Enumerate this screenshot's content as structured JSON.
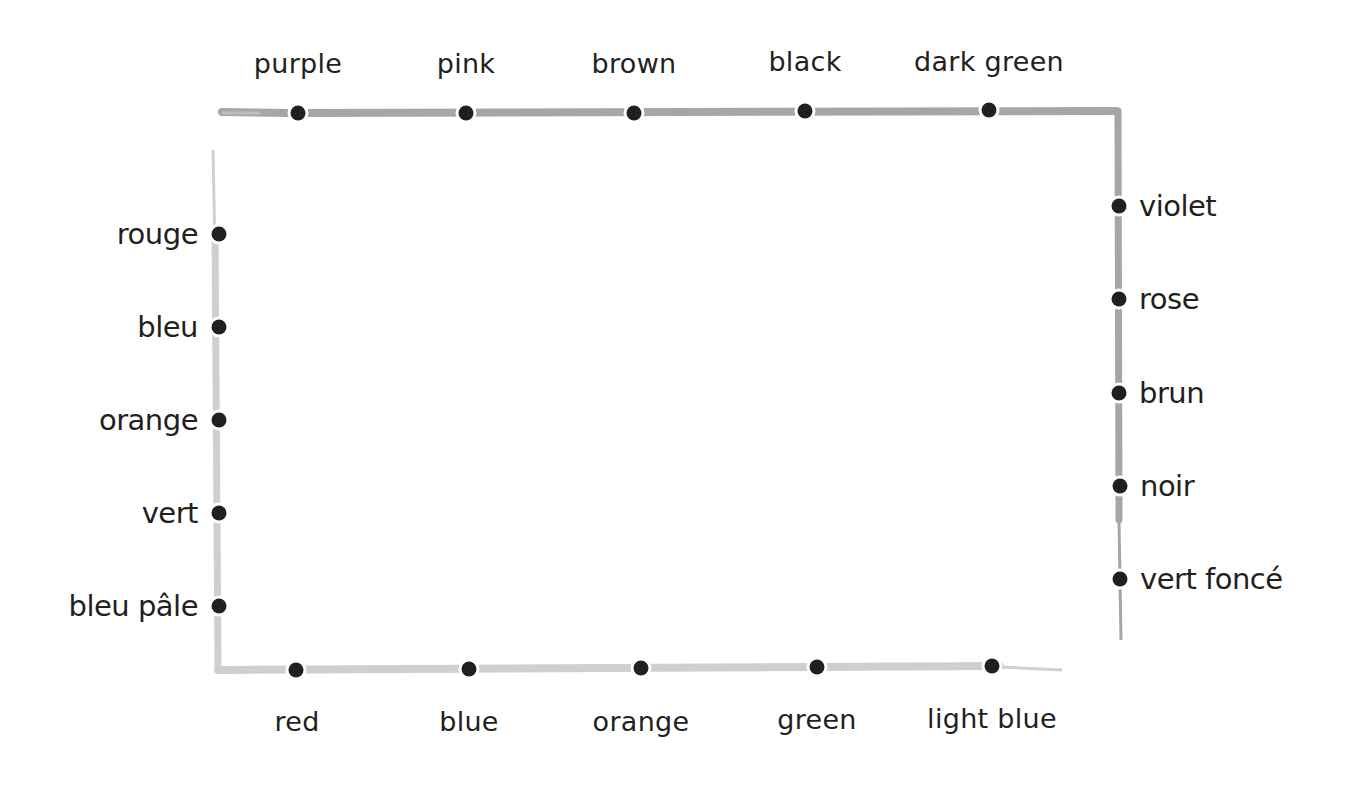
{
  "worksheet": {
    "activity": "Match English color names to French color names",
    "top_words": [
      {
        "label": "purple",
        "x": 298,
        "dot_y": 113
      },
      {
        "label": "pink",
        "x": 466,
        "dot_y": 113
      },
      {
        "label": "brown",
        "x": 634,
        "dot_y": 113
      },
      {
        "label": "black",
        "x": 805,
        "dot_y": 111
      },
      {
        "label": "dark green",
        "x": 989,
        "dot_y": 110
      }
    ],
    "bottom_words": [
      {
        "label": "red",
        "x": 296,
        "dot_y": 670
      },
      {
        "label": "blue",
        "x": 469,
        "dot_y": 669
      },
      {
        "label": "orange",
        "x": 641,
        "dot_y": 668
      },
      {
        "label": "green",
        "x": 817,
        "dot_y": 667
      },
      {
        "label": "light blue",
        "x": 992,
        "dot_y": 666
      }
    ],
    "left_words": [
      {
        "label": "rouge",
        "y": 234,
        "dot_x": 219
      },
      {
        "label": "bleu",
        "y": 327,
        "dot_x": 219
      },
      {
        "label": "orange",
        "y": 420,
        "dot_x": 219
      },
      {
        "label": "vert",
        "y": 513,
        "dot_x": 219
      },
      {
        "label": "bleu pâle",
        "y": 606,
        "dot_x": 219
      }
    ],
    "right_words": [
      {
        "label": "violet",
        "y": 206,
        "dot_x": 1119
      },
      {
        "label": "rose",
        "y": 299,
        "dot_x": 1119
      },
      {
        "label": "brun",
        "y": 393,
        "dot_x": 1119
      },
      {
        "label": "noir",
        "y": 486,
        "dot_x": 1119
      },
      {
        "label": "vert foncé",
        "y": 579,
        "dot_x": 1119
      }
    ],
    "colors": {
      "ink": "#231f20",
      "frame_dark": "#a6a6a6",
      "frame_light": "#cfcfcf"
    }
  }
}
